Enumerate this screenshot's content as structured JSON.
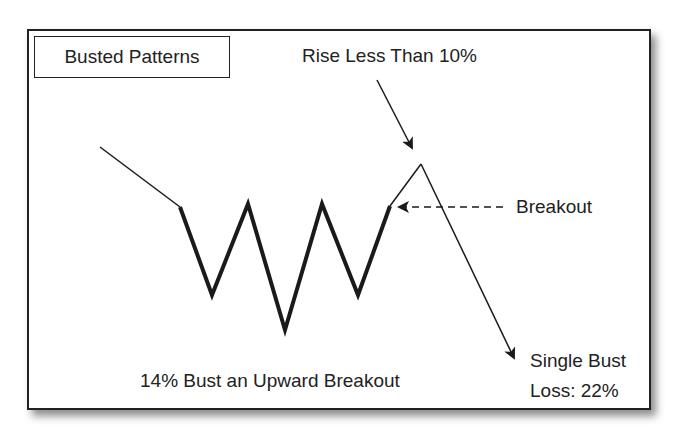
{
  "title": "Busted Patterns",
  "annotations": {
    "rise": "Rise Less Than 10%",
    "breakout": "Breakout",
    "bust_line1": "Single Bust",
    "bust_line2": "Loss: 22%",
    "caption": "14% Bust an Upward Breakout"
  },
  "colors": {
    "line": "#1a1a1a",
    "border": "#222222",
    "background": "#ffffff"
  },
  "pattern": {
    "lead_in": [
      [
        100,
        147
      ],
      [
        180,
        207
      ]
    ],
    "zigzag": [
      [
        180,
        207
      ],
      [
        212,
        295
      ],
      [
        248,
        204
      ],
      [
        285,
        330
      ],
      [
        322,
        204
      ],
      [
        358,
        295
      ],
      [
        390,
        206
      ]
    ],
    "bust_path": [
      [
        390,
        206
      ],
      [
        421,
        164
      ],
      [
        510,
        355
      ]
    ]
  }
}
